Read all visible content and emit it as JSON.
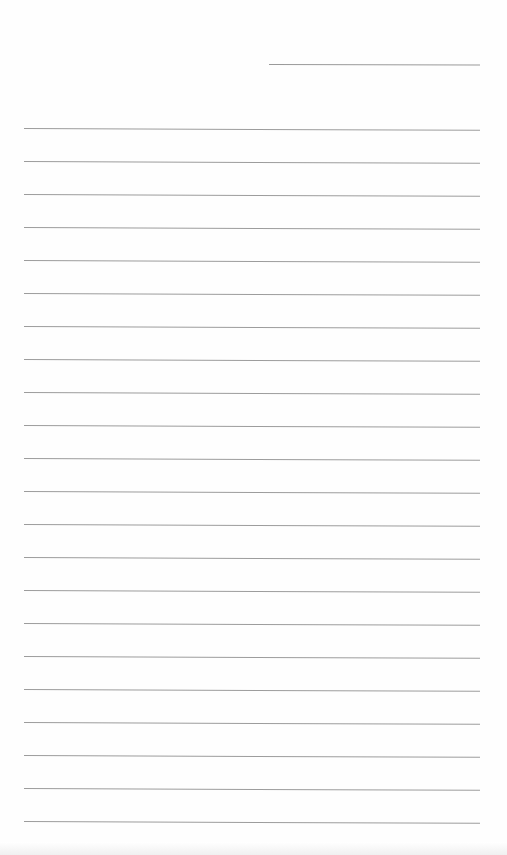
{
  "page": {
    "type": "lined-notepaper",
    "background_color": "#fefefe",
    "line_color": "#9c9c9c",
    "header_line": {
      "x": 269,
      "y": 64,
      "width": 211
    },
    "ruled_lines": {
      "x": 24,
      "width": 456,
      "start_y": 128,
      "spacing": 33,
      "count": 22
    },
    "text_content": []
  }
}
